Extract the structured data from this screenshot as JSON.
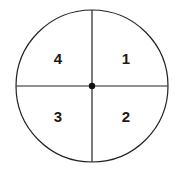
{
  "diagram": {
    "type": "circle-quadrants",
    "quadrants": [
      {
        "position": "top-right",
        "label": "1"
      },
      {
        "position": "bottom-right",
        "label": "2"
      },
      {
        "position": "bottom-left",
        "label": "3"
      },
      {
        "position": "top-left",
        "label": "4"
      }
    ],
    "colors": {
      "stroke": "#222222",
      "background": "#ffffff"
    }
  }
}
